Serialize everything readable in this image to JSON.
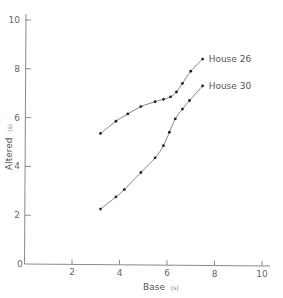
{
  "chart_data": {
    "type": "line",
    "title": "",
    "xlabel": "Base",
    "xlabel_unit": "(s)",
    "ylabel": "Altered",
    "ylabel_unit": "(s)",
    "xlim": [
      0,
      10
    ],
    "ylim": [
      0,
      10
    ],
    "xticks": [
      2,
      4,
      6,
      8,
      10
    ],
    "yticks": [
      0,
      2,
      4,
      6,
      8,
      10
    ],
    "origin_label": "0",
    "grid": false,
    "legend_position": "inline, at end of each curve",
    "series": [
      {
        "name": "House 26",
        "x": [
          3.2,
          3.85,
          4.35,
          4.9,
          5.5,
          5.85,
          6.15,
          6.4,
          6.65,
          7.0,
          7.5
        ],
        "y": [
          5.35,
          5.85,
          6.15,
          6.45,
          6.65,
          6.75,
          6.85,
          7.05,
          7.4,
          7.9,
          8.4
        ]
      },
      {
        "name": "House 30",
        "x": [
          3.2,
          3.85,
          4.2,
          4.9,
          5.5,
          5.85,
          6.1,
          6.35,
          6.65,
          6.95,
          7.5
        ],
        "y": [
          2.25,
          2.75,
          3.05,
          3.75,
          4.35,
          4.85,
          5.4,
          5.95,
          6.35,
          6.7,
          7.3
        ]
      }
    ]
  },
  "colors": {
    "axis": "#8a8a8a",
    "line": "#777777",
    "marker": "#222222",
    "text": "#555555"
  }
}
